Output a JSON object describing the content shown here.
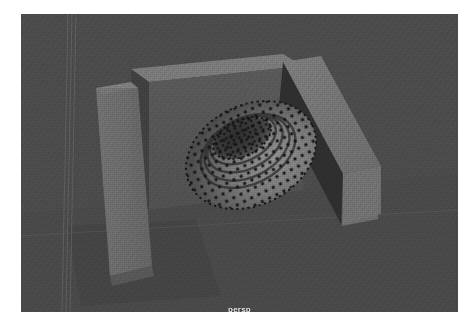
{
  "window": {
    "title": "persp",
    "background_color": "#ffffff"
  },
  "viewport": {
    "name": "persp",
    "camera_label": "persp",
    "renderer": "shaded",
    "background_color": "#4a4a4a",
    "x": 21,
    "y": 14,
    "width": 437,
    "height": 298
  },
  "grid": {
    "visible": true,
    "color": "#565656",
    "vertical_lines": 3,
    "horizon_line_color": "#5a5a5a"
  },
  "scene": {
    "objects": [
      {
        "name": "pTorus1",
        "type": "torus",
        "label": "torus",
        "display": "vertices",
        "vertex_color": "#1c1c1c",
        "surface_light": "#8a8a8a",
        "surface_dark": "#3d3d3d",
        "center_x": 230,
        "center_y": 155,
        "radius_x": 66,
        "radius_y": 48
      },
      {
        "name": "pCube1",
        "type": "box",
        "label": "left-slab",
        "face_color": "#6e6e6e",
        "top_color": "#7c7c7c",
        "side_color": "#5a5a5a"
      },
      {
        "name": "pCube2",
        "type": "box",
        "label": "back-slab",
        "face_color": "#555555",
        "top_color": "#777777",
        "side_color": "#3e3e3e"
      },
      {
        "name": "pCube3",
        "type": "box",
        "label": "right-slab",
        "face_color": "#2f2f2f",
        "top_color": "#747474",
        "side_color": "#6a6a6a"
      },
      {
        "name": "groundPlane",
        "type": "plane",
        "label": "ground-shadow",
        "face_color": "#434343"
      }
    ]
  }
}
